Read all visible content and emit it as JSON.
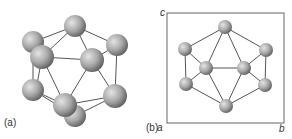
{
  "figure": {
    "panel_a": {
      "label": "(a)",
      "atoms": [
        {
          "x": 75,
          "y": 26,
          "r": 11
        },
        {
          "x": 33,
          "y": 42,
          "r": 11
        },
        {
          "x": 117,
          "y": 45,
          "r": 11
        },
        {
          "x": 42,
          "y": 57,
          "r": 12
        },
        {
          "x": 92,
          "y": 60,
          "r": 12
        },
        {
          "x": 33,
          "y": 90,
          "r": 11
        },
        {
          "x": 115,
          "y": 96,
          "r": 12
        },
        {
          "x": 75,
          "y": 116,
          "r": 11
        },
        {
          "x": 65,
          "y": 105,
          "r": 12
        }
      ]
    },
    "panel_b": {
      "label": "(b)",
      "axes": {
        "a": "a",
        "b": "b",
        "c": "c"
      },
      "atoms": [
        {
          "x": 225,
          "y": 27
        },
        {
          "x": 185,
          "y": 49
        },
        {
          "x": 186,
          "y": 84
        },
        {
          "x": 206,
          "y": 68
        },
        {
          "x": 244,
          "y": 68
        },
        {
          "x": 266,
          "y": 50
        },
        {
          "x": 265,
          "y": 85
        },
        {
          "x": 226,
          "y": 106
        }
      ]
    },
    "colors": {
      "atom_light": "#d8d8d8",
      "atom_dark": "#6a6a6a",
      "bond": "#555555",
      "frame": "#666666"
    }
  }
}
